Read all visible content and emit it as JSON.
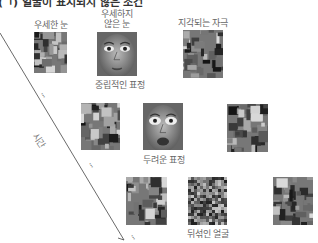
{
  "title": "(ㄱ) 얼굴이 표시되지 않은 조건",
  "timeline": {
    "label": "시간"
  },
  "rows": [
    {
      "labels": {
        "left": "우세한 눈",
        "middle": "우세하지\n않은 눈",
        "right": "지각되는 자극"
      },
      "caption": "중립적인 표정",
      "tiles": [
        {
          "kind": "mosaic",
          "x": 34,
          "y": 32,
          "w": 33,
          "h": 41
        },
        {
          "kind": "face-neutral",
          "x": 97,
          "y": 32,
          "w": 40,
          "h": 44
        },
        {
          "kind": "mosaic",
          "x": 183,
          "y": 30,
          "w": 40,
          "h": 48
        }
      ]
    },
    {
      "caption": "두려운 표정",
      "tiles": [
        {
          "kind": "mosaic",
          "x": 81,
          "y": 103,
          "w": 39,
          "h": 47
        },
        {
          "kind": "face-fearful",
          "x": 143,
          "y": 103,
          "w": 40,
          "h": 47
        },
        {
          "kind": "mosaic",
          "x": 227,
          "y": 104,
          "w": 41,
          "h": 48
        }
      ]
    },
    {
      "caption": "뒤섞인 얼굴",
      "tiles": [
        {
          "kind": "mosaic",
          "x": 126,
          "y": 177,
          "w": 41,
          "h": 48
        },
        {
          "kind": "scrambled",
          "x": 188,
          "y": 177,
          "w": 39,
          "h": 48
        },
        {
          "kind": "mosaic",
          "x": 273,
          "y": 177,
          "w": 40,
          "h": 48
        }
      ]
    }
  ],
  "ellipsis": "⋰"
}
